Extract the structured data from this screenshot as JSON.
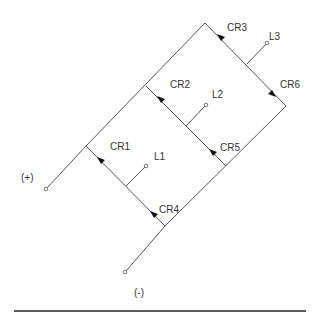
{
  "diagram": {
    "labels": {
      "CR1": "CR1",
      "CR2": "CR2",
      "CR3": "CR3",
      "CR4": "CR4",
      "CR5": "CR5",
      "CR6": "CR6",
      "L1": "L1",
      "L2": "L2",
      "L3": "L3",
      "plus": "(+)",
      "minus": "(-)"
    },
    "colors": {
      "wire": "#555555",
      "text": "#333333",
      "arrow": "#111111",
      "rule": "#222222"
    }
  }
}
